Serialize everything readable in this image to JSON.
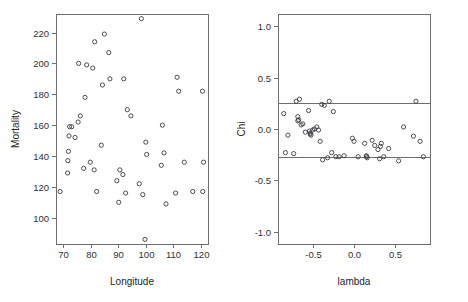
{
  "figure": {
    "width": 468,
    "height": 302,
    "background": "#ffffff",
    "panel_count": 2
  },
  "chart_data": [
    {
      "type": "scatter",
      "panel": "left",
      "title": "",
      "xlabel": "Longitude",
      "ylabel": "Mortality",
      "xlim": [
        67.5,
        122.5
      ],
      "ylim": [
        83,
        232
      ],
      "xticks": [
        70,
        80,
        90,
        100,
        110,
        120
      ],
      "xticklabels": [
        "70",
        "80",
        "90",
        "100",
        "110",
        "120"
      ],
      "yticks": [
        100,
        120,
        140,
        160,
        180,
        200,
        220
      ],
      "yticklabels": [
        "100",
        "120",
        "140",
        "160",
        "180",
        "200",
        "220"
      ],
      "grid": false,
      "legend": null,
      "marker": "open-circle",
      "marker_color": "#3b3b3f",
      "x": [
        69.0,
        71.7,
        71.8,
        72.0,
        72.2,
        72.4,
        73.2,
        74.4,
        75.5,
        75.7,
        76.3,
        77.5,
        78.0,
        78.6,
        79.9,
        80.8,
        81.3,
        81.5,
        82.2,
        83.9,
        84.3,
        85.0,
        86.6,
        87.0,
        89.5,
        90.2,
        90.6,
        91.7,
        92.0,
        92.7,
        93.3,
        94.6,
        97.6,
        98.4,
        98.9,
        99.7,
        100.0,
        100.3,
        105.6,
        106.0,
        106.6,
        107.3,
        110.8,
        111.3,
        111.9,
        113.9,
        117.0,
        120.5,
        120.6,
        120.9
      ],
      "y": [
        117,
        129,
        137,
        143,
        153,
        159,
        159,
        152,
        162,
        200,
        166,
        132,
        178,
        199,
        136,
        197,
        131,
        214,
        117,
        147,
        186,
        219,
        207,
        190,
        124,
        110,
        131,
        128,
        190,
        116,
        170,
        166,
        122,
        229,
        115,
        86,
        149,
        141,
        134,
        160,
        142,
        109,
        116,
        191,
        182,
        136,
        117,
        182,
        117,
        136
      ]
    },
    {
      "type": "scatter",
      "panel": "right",
      "title": "",
      "xlabel": "lambda",
      "ylabel": "Chi",
      "xlim": [
        -0.92,
        0.92
      ],
      "ylim": [
        -1.12,
        1.12
      ],
      "xticks": [
        -0.5,
        0.0,
        0.5
      ],
      "xticklabels": [
        "-0.5",
        "0.0",
        "0.5"
      ],
      "yticks": [
        -1.0,
        -0.5,
        0.0,
        0.5,
        1.0
      ],
      "yticklabels": [
        "-1.0",
        "-0.5",
        "0.0",
        "0.5",
        "1.0"
      ],
      "grid": false,
      "legend": null,
      "marker": "open-circle",
      "marker_color": "#3b3b3f",
      "reference_lines": [
        {
          "orientation": "horizontal",
          "value": 0.25,
          "color": "#6e6e72"
        },
        {
          "orientation": "horizontal",
          "value": -0.27,
          "color": "#6e6e72"
        }
      ],
      "x": [
        -0.85,
        -0.83,
        -0.8,
        -0.73,
        -0.7,
        -0.68,
        -0.68,
        -0.67,
        -0.66,
        -0.64,
        -0.62,
        -0.59,
        -0.55,
        -0.54,
        -0.53,
        -0.53,
        -0.52,
        -0.5,
        -0.48,
        -0.45,
        -0.43,
        -0.41,
        -0.39,
        -0.38,
        -0.36,
        -0.32,
        -0.3,
        -0.27,
        -0.25,
        -0.22,
        -0.18,
        -0.12,
        -0.02,
        0.0,
        0.05,
        0.13,
        0.15,
        0.15,
        0.16,
        0.22,
        0.25,
        0.29,
        0.31,
        0.32,
        0.33,
        0.36,
        0.42,
        0.54,
        0.6,
        0.72,
        0.75,
        0.8,
        0.84
      ],
      "y": [
        0.15,
        -0.23,
        -0.06,
        -0.24,
        0.27,
        0.12,
        0.08,
        0.09,
        0.29,
        0.04,
        0.05,
        -0.03,
        0.18,
        -0.02,
        -0.04,
        -0.05,
        -0.06,
        -0.01,
        0.0,
        0.02,
        -0.01,
        -0.12,
        0.24,
        -0.3,
        0.23,
        -0.28,
        0.27,
        -0.23,
        0.17,
        -0.27,
        -0.27,
        -0.26,
        -0.09,
        -0.12,
        -0.27,
        -0.14,
        -0.26,
        -0.27,
        -0.28,
        -0.11,
        -0.16,
        -0.2,
        -0.29,
        -0.17,
        -0.14,
        -0.27,
        -0.19,
        -0.31,
        0.02,
        -0.07,
        0.27,
        -0.12,
        -0.27
      ]
    }
  ]
}
